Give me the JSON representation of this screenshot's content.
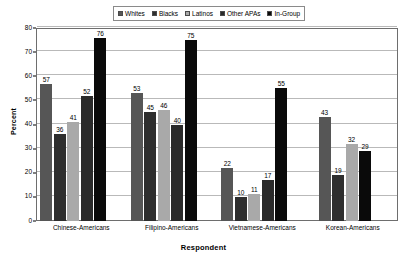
{
  "chart_data": {
    "type": "bar",
    "title": "",
    "xlabel": "Respondent",
    "ylabel": "Percent",
    "ylim": [
      0,
      80
    ],
    "ytick_step": 10,
    "yticks": [
      0,
      10,
      20,
      30,
      40,
      50,
      60,
      70,
      80
    ],
    "grid": true,
    "legend_position": "top-center",
    "orientation": "vertical",
    "grouping": "grouped",
    "categories": [
      "Chinese-Americans",
      "Filipino-Americans",
      "Vietnamese-Americans",
      "Korean-Americans"
    ],
    "series": [
      {
        "name": "Whites",
        "color": "#565656",
        "values": [
          57,
          53,
          22,
          43
        ]
      },
      {
        "name": "Blacks",
        "color": "#2e2e2e",
        "values": [
          36,
          45,
          10,
          19
        ]
      },
      {
        "name": "Latinos",
        "color": "#a9a9a9",
        "values": [
          41,
          46,
          11,
          32
        ]
      },
      {
        "name": "Other APAs",
        "color": "#2a2a2a",
        "values": [
          52,
          40,
          17,
          null
        ]
      },
      {
        "name": "In-Group",
        "color": "#0a0a0a",
        "values": [
          76,
          75,
          55,
          29
        ]
      }
    ]
  },
  "legend": {
    "items": [
      {
        "label": "Whites"
      },
      {
        "label": "Blacks"
      },
      {
        "label": "Latinos"
      },
      {
        "label": "Other APAs"
      },
      {
        "label": "In-Group"
      }
    ]
  }
}
